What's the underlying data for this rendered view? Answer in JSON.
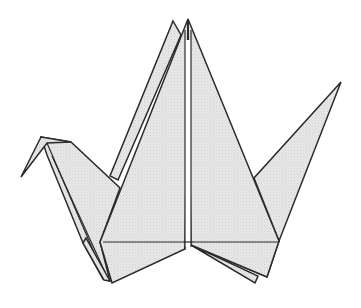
{
  "image": {
    "subject": "Origami paper crane line illustration",
    "background_color": "#ffffff",
    "paper_color": "#e6e6e6",
    "stroke_color": "#2b2b2b"
  }
}
